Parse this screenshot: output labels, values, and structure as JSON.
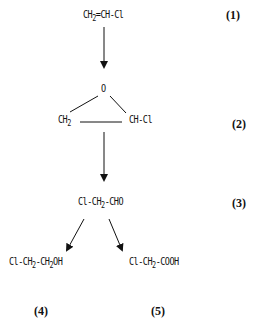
{
  "diagram": {
    "type": "reaction-scheme",
    "compounds": [
      {
        "id": "1",
        "label": "(1)",
        "parts": [
          "CH",
          "2",
          "=CH-Cl"
        ],
        "formula": "CH2=CH-Cl"
      },
      {
        "id": "2",
        "label": "(2)",
        "oxygen": "O",
        "left": [
          "CH",
          "2"
        ],
        "right": "CH-Cl",
        "formula": "epoxide CH2-O-CH-Cl"
      },
      {
        "id": "3",
        "label": "(3)",
        "parts": [
          "Cl-CH",
          "2",
          "-CHO"
        ],
        "formula": "Cl-CH2-CHO"
      },
      {
        "id": "4",
        "label": "(4)",
        "parts": [
          "Cl-CH",
          "2",
          "-CH",
          "2",
          "OH"
        ],
        "formula": "Cl-CH2-CH2OH"
      },
      {
        "id": "5",
        "label": "(5)",
        "parts": [
          "Cl-CH",
          "2",
          "-COOH"
        ],
        "formula": "Cl-CH2-COOH"
      }
    ],
    "arrows": [
      {
        "from": "1",
        "to": "2"
      },
      {
        "from": "2",
        "to": "3"
      },
      {
        "from": "3",
        "to": "4"
      },
      {
        "from": "3",
        "to": "5"
      }
    ]
  }
}
